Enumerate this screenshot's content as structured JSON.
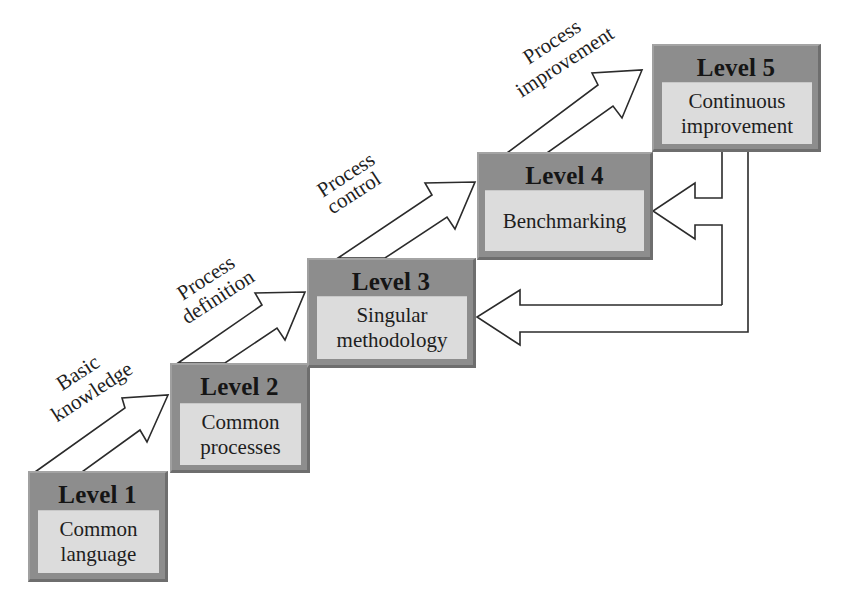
{
  "diagram": {
    "type": "staircase maturity model",
    "levels": [
      {
        "title": "Level 1",
        "description": [
          "Common",
          "language"
        ]
      },
      {
        "title": "Level 2",
        "description": [
          "Common",
          "processes"
        ]
      },
      {
        "title": "Level 3",
        "description": [
          "Singular",
          "methodology"
        ]
      },
      {
        "title": "Level 4",
        "description": [
          "Benchmarking"
        ]
      },
      {
        "title": "Level 5",
        "description": [
          "Continuous",
          "improvement"
        ]
      }
    ],
    "transitions": [
      {
        "from": "Level 1",
        "to": "Level 2",
        "label": [
          "Basic",
          "knowledge"
        ]
      },
      {
        "from": "Level 2",
        "to": "Level 3",
        "label": [
          "Process",
          "definition"
        ]
      },
      {
        "from": "Level 3",
        "to": "Level 4",
        "label": [
          "Process",
          "control"
        ]
      },
      {
        "from": "Level 4",
        "to": "Level 5",
        "label": [
          "Process",
          "improvement"
        ]
      }
    ],
    "feedback_loops": [
      {
        "from": "Level 5",
        "to": "Level 4"
      },
      {
        "from": "Level 5",
        "to": "Level 3"
      }
    ],
    "colors": {
      "box_frame": "#8d8d8d",
      "box_panel": "#dcdcdc",
      "arrow_stroke": "#2b2b2b",
      "arrow_fill": "#ffffff",
      "background": "#ffffff"
    }
  }
}
